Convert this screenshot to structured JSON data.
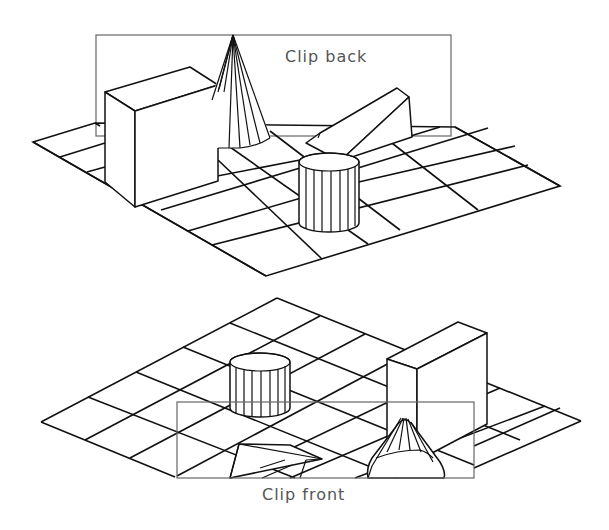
{
  "figure": {
    "top_panel": {
      "label": "Clip back",
      "clip_plane": "back",
      "objects": [
        "box",
        "cone",
        "wedge",
        "cylinder"
      ],
      "grid": "5x5 ground plane"
    },
    "bottom_panel": {
      "label": "Clip front",
      "clip_plane": "front",
      "objects": [
        "cylinder",
        "box",
        "clipped wedge",
        "clipped cone"
      ],
      "grid": "5x5 ground plane"
    },
    "colors": {
      "line": "#111111",
      "clip_rect": "#666666",
      "label": "#555555",
      "background": "#ffffff"
    }
  }
}
